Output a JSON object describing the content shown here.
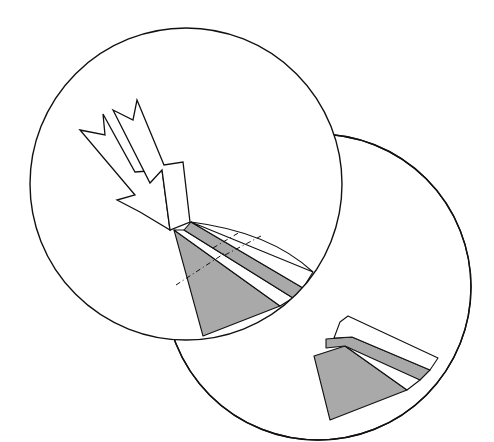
{
  "diagram": {
    "colors": {
      "background": "#ffffff",
      "stroke": "#111111",
      "shade": "#a9a9a9"
    },
    "circles": [
      {
        "name": "front-detail-circle",
        "cx": 186,
        "cy": 184,
        "r": 156
      },
      {
        "name": "back-detail-circle",
        "cx": 318,
        "cy": 287,
        "r": 153
      }
    ],
    "arrows": [
      {
        "name": "incident-arrow-outer",
        "points": "80,130 105,135 103,114 135,172 162,170 170,230 140,212 117,200 135,195"
      },
      {
        "name": "incident-arrow-inner",
        "points": "113,110 133,120 137,100 164,165 183,162 190,222 170,230 162,170 150,183"
      }
    ],
    "front_layers": [
      {
        "name": "substrate-wedge",
        "fill": "shade",
        "points": "174,230 280,306 203,336"
      },
      {
        "name": "layer-gap-1",
        "fill": "white",
        "points": "184,230 293,298 280,306 174,230"
      },
      {
        "name": "layer-2",
        "fill": "shade",
        "points": "191,222 303,288 293,298 184,230"
      },
      {
        "name": "layer-3-top",
        "fill": "white",
        "points": "191,222 313,272 303,288"
      }
    ],
    "back_layers": [
      {
        "name": "back-substrate",
        "fill": "shade",
        "points": "314,356 345,346 407,390 330,420"
      },
      {
        "name": "back-gap",
        "fill": "white",
        "points": "345,346 352,337 420,380 407,390"
      },
      {
        "name": "back-layer-2",
        "fill": "shade",
        "points": "326,339 352,337 430,370 420,380 345,346 326,348"
      },
      {
        "name": "back-layer-top",
        "fill": "white",
        "points": "348,316 438,358 430,370 352,337 334,338 340,322"
      }
    ],
    "dash_lines": [
      {
        "name": "section-line-1",
        "x1": 176,
        "y1": 285,
        "x2": 225,
        "y2": 253
      },
      {
        "name": "section-line-2",
        "x1": 225,
        "y1": 255,
        "x2": 261,
        "y2": 236
      },
      {
        "name": "section-line-3",
        "x1": 213,
        "y1": 248,
        "x2": 240,
        "y2": 232
      }
    ]
  }
}
